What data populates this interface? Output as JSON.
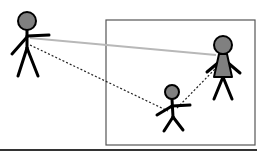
{
  "diagram": {
    "colors": {
      "background": "#ffffff",
      "figure_stroke": "#000000",
      "figure_fill": "#808080",
      "frame_stroke": "#555555",
      "solid_line": "#b8b8b8",
      "dotted_line": "#222222",
      "baseline": "#333333"
    },
    "frame": {
      "x": 106,
      "y": 20,
      "width": 149,
      "height": 125
    },
    "baseline": {
      "x1": 0,
      "y1": 150,
      "x2": 257,
      "y2": 150
    },
    "figures": [
      {
        "id": "left-adult",
        "head": {
          "cx": 27,
          "cy": 21,
          "r": 9
        },
        "body": {
          "x1": 27,
          "y1": 30,
          "x2": 27,
          "y2": 48
        },
        "arms": [
          {
            "x1": 27,
            "y1": 37,
            "x2": 12,
            "y2": 54
          },
          {
            "x1": 27,
            "y1": 36,
            "x2": 49,
            "y2": 35
          }
        ],
        "legs": [
          {
            "x1": 27,
            "y1": 48,
            "x2": 18,
            "y2": 76
          },
          {
            "x1": 27,
            "y1": 48,
            "x2": 38,
            "y2": 76
          }
        ]
      },
      {
        "id": "right-woman",
        "head": {
          "cx": 223,
          "cy": 45,
          "r": 9
        },
        "dress": "219,54 227,54 232,77 214,77",
        "arms": [
          {
            "x1": 219,
            "y1": 62,
            "x2": 207,
            "y2": 72
          },
          {
            "x1": 227,
            "y1": 62,
            "x2": 240,
            "y2": 73
          }
        ],
        "legs": [
          {
            "x1": 223,
            "y1": 77,
            "x2": 214,
            "y2": 99
          },
          {
            "x1": 223,
            "y1": 77,
            "x2": 232,
            "y2": 99
          }
        ]
      },
      {
        "id": "small-child",
        "head": {
          "cx": 172,
          "cy": 92,
          "r": 7
        },
        "body": {
          "x1": 172,
          "y1": 99,
          "x2": 173,
          "y2": 117
        },
        "arms": [
          {
            "x1": 172,
            "y1": 106,
            "x2": 157,
            "y2": 115
          },
          {
            "x1": 172,
            "y1": 106,
            "x2": 190,
            "y2": 105
          }
        ],
        "legs": [
          {
            "x1": 173,
            "y1": 117,
            "x2": 164,
            "y2": 131
          },
          {
            "x1": 173,
            "y1": 117,
            "x2": 183,
            "y2": 130
          }
        ]
      }
    ],
    "connections": [
      {
        "id": "adult-to-woman-solid",
        "style": "solid",
        "x1": 30,
        "y1": 38,
        "x2": 216,
        "y2": 55
      },
      {
        "id": "adult-to-child-dotted",
        "style": "dotted",
        "x1": 30,
        "y1": 45,
        "x2": 168,
        "y2": 111
      },
      {
        "id": "child-to-woman-dotted",
        "style": "dotted",
        "x1": 177,
        "y1": 108,
        "x2": 217,
        "y2": 67
      }
    ]
  }
}
